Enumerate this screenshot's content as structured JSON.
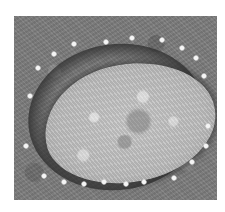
{
  "image": {
    "description": "Grayscale electron micrograph of an oval particle with a dark halo, surrounded by a ring of small bright dots",
    "colors": {
      "background": "#ffffff",
      "field": "#7d7d7d",
      "particle": "#c0c0c0",
      "halo": "#2d2d2d",
      "dots": "#f4f4f4"
    },
    "dots": [
      {
        "x": 40,
        "y": 38
      },
      {
        "x": 60,
        "y": 28
      },
      {
        "x": 92,
        "y": 26
      },
      {
        "x": 118,
        "y": 22
      },
      {
        "x": 148,
        "y": 24
      },
      {
        "x": 168,
        "y": 32
      },
      {
        "x": 182,
        "y": 42
      },
      {
        "x": 190,
        "y": 60
      },
      {
        "x": 194,
        "y": 110
      },
      {
        "x": 192,
        "y": 130
      },
      {
        "x": 178,
        "y": 146
      },
      {
        "x": 160,
        "y": 162
      },
      {
        "x": 130,
        "y": 166
      },
      {
        "x": 112,
        "y": 168
      },
      {
        "x": 90,
        "y": 166
      },
      {
        "x": 70,
        "y": 168
      },
      {
        "x": 50,
        "y": 166
      },
      {
        "x": 30,
        "y": 160
      },
      {
        "x": 12,
        "y": 130
      },
      {
        "x": 16,
        "y": 80
      },
      {
        "x": 24,
        "y": 52
      }
    ]
  }
}
